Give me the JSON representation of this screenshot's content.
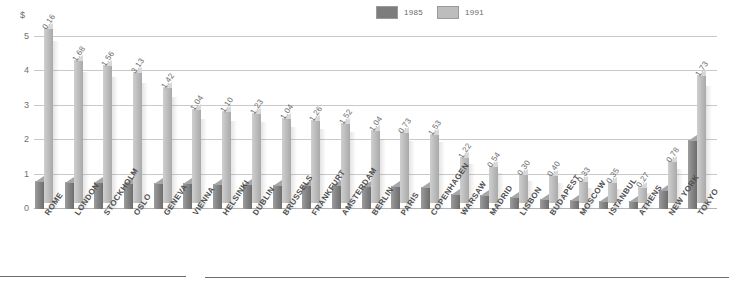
{
  "axis": {
    "currency_symbol": "$",
    "yticks": [
      "5",
      "4",
      "3",
      "2",
      "1",
      "0"
    ]
  },
  "legend": {
    "items": [
      {
        "label": "1985",
        "color": "#7d7d7d"
      },
      {
        "label": "1991",
        "color": "#bdbdbd"
      }
    ]
  },
  "chart_data": {
    "type": "bar",
    "title": "",
    "subtitle": "",
    "xlabel": "",
    "ylabel": "$",
    "ylim": [
      0,
      5
    ],
    "yticks": [
      0,
      1,
      2,
      3,
      4,
      5
    ],
    "grid": true,
    "legend_position": "top-center",
    "categories": [
      "ROME",
      "LONDON",
      "STOCKHOLM",
      "OSLO",
      "GENEVA",
      "VIENNA",
      "HELSINKI",
      "DUBLIN",
      "BRUSSELS",
      "FRANKFURT",
      "AMSTERDAM",
      "BERLIN",
      "PARIS",
      "COPENHAGEN",
      "WARSAW",
      "MADRID",
      "LISBON",
      "BUDAPEST",
      "MOSCOW",
      "ISTANBUL",
      "ATHENS",
      "NEW YORK",
      "TOKYO"
    ],
    "series": [
      {
        "name": "1985",
        "color": "#7d7d7d",
        "values": [
          0.8,
          0.78,
          0.78,
          0.77,
          0.76,
          0.75,
          0.74,
          0.72,
          0.71,
          0.7,
          0.7,
          0.68,
          0.66,
          0.64,
          0.45,
          0.42,
          0.34,
          0.3,
          0.26,
          0.24,
          0.22,
          0.56,
          2.0
        ]
      },
      {
        "name": "1991",
        "color": "#bdbdbd",
        "values": [
          5.1,
          4.15,
          4.0,
          3.82,
          3.38,
          2.72,
          2.68,
          2.62,
          2.48,
          2.42,
          2.32,
          2.12,
          2.05,
          2.02,
          1.35,
          1.08,
          0.85,
          0.8,
          0.65,
          0.6,
          0.48,
          1.22,
          3.72
        ]
      }
    ],
    "data_labels": [
      "0.16",
      "1.68",
      "1.56",
      "3.13",
      "1.42",
      "1.04",
      "1.10",
      "1.23",
      "1.04",
      "1.26",
      "1.52",
      "1.04",
      "0.73",
      "1.53",
      "1.22",
      "0.54",
      "0.30",
      "0.40",
      "0.33",
      "0.35",
      "0.27",
      "0.78",
      "1.73"
    ]
  }
}
